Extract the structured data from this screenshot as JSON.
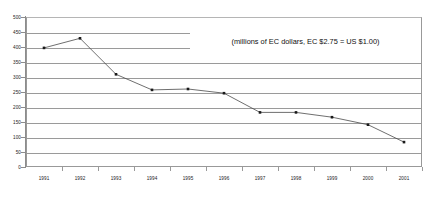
{
  "chart_data": {
    "type": "line",
    "title": "",
    "subtitle": "",
    "annotation": "(millions of EC dollars, EC $2.75 = US $1.00)",
    "xlabel": "",
    "ylabel": "",
    "categories": [
      "1991",
      "1992",
      "1993",
      "1994",
      "1995",
      "1996",
      "1997",
      "1998",
      "1999",
      "2000",
      "2001"
    ],
    "values": [
      397,
      429,
      309,
      257,
      260,
      246,
      182,
      182,
      166,
      141,
      83
    ],
    "series": [
      {
        "name": "",
        "values": [
          397,
          429,
          309,
          257,
          260,
          246,
          182,
          182,
          166,
          141,
          83
        ]
      }
    ],
    "ylim": [
      0,
      500
    ],
    "ytick_values": [
      0,
      50,
      100,
      150,
      200,
      250,
      300,
      350,
      400,
      450,
      500
    ],
    "ytick_labels": [
      "0",
      "50",
      "100",
      "150",
      "200",
      "250",
      "300",
      "350",
      "400",
      "450",
      "500"
    ],
    "xtick_labels": [
      "1991",
      "1992",
      "1993",
      "1994",
      "1995",
      "1996",
      "1997",
      "1998",
      "1999",
      "2000",
      "2001"
    ],
    "grid": "horizontal",
    "legend": "none",
    "marker": "square",
    "line_color": "#4a4a4a",
    "marker_color": "#1a1a1a",
    "gridline_color": "#9a9a9a",
    "plot_background": "#ffffff",
    "axis_color": "#8c8c8c"
  }
}
